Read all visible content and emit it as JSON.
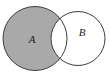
{
  "figure": {
    "kind": "venn-diagram",
    "background_color": "#ffffff",
    "outline_color": "#3c3c3c",
    "shade_color": "#a9a9a9",
    "label_color": "#1a1a1a",
    "width": 109,
    "height": 77
  },
  "sets": [
    {
      "id": "A",
      "label": "A",
      "label_x": 32,
      "label_y": 43,
      "cx": 35,
      "cy": 38.5,
      "r": 32,
      "fill": "#a9a9a9",
      "filled": "true"
    },
    {
      "id": "B",
      "label": "B",
      "label_x": 82,
      "label_y": 36,
      "cx": 78,
      "cy": 38.5,
      "r": 27,
      "fill": "#ffffff",
      "filled": "false"
    }
  ],
  "shaded_region": {
    "name": "A-minus-B",
    "notation": "A \\ B",
    "fill": "#a9a9a9"
  },
  "unshaded_regions": [
    {
      "name": "A-intersect-B",
      "notation": "A ∩ B",
      "fill": "#ffffff"
    },
    {
      "name": "B-minus-A",
      "notation": "B \\ A",
      "fill": "#ffffff"
    }
  ],
  "intersection_points": [
    {
      "x": 58,
      "y": 19
    },
    {
      "x": 58,
      "y": 58
    }
  ]
}
